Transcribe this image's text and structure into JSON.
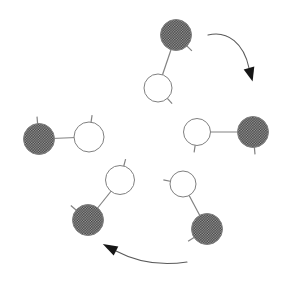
{
  "canvas": {
    "width": 295,
    "height": 284,
    "background": "#ffffff"
  },
  "colors": {
    "atom_outline": "#808080",
    "bond": "#828282",
    "open_atom_fill": "#ffffff",
    "shaded_atom_base": "#a2a2a2",
    "shaded_atom_dot": "#3a3a3a",
    "arrow_stroke": "#5a5a5a",
    "arrowhead_fill": "#161616"
  },
  "tick_len": 7,
  "molecules": [
    {
      "name": "top",
      "shaded": {
        "cx": 176,
        "cy": 35,
        "r": 15.5,
        "tick_angle": 45
      },
      "open": {
        "cx": 158,
        "cy": 88,
        "r": 14,
        "tick_angle": 48
      }
    },
    {
      "name": "right",
      "open": {
        "cx": 197,
        "cy": 132,
        "r": 13.5,
        "tick_angle": 98
      },
      "shaded": {
        "cx": 253,
        "cy": 132,
        "r": 15.5,
        "tick_angle": 85
      }
    },
    {
      "name": "left",
      "shaded": {
        "cx": 39,
        "cy": 139,
        "r": 15.5,
        "tick_angle": -95
      },
      "open": {
        "cx": 89,
        "cy": 137,
        "r": 15,
        "tick_angle": -82
      }
    },
    {
      "name": "bottom-left",
      "open": {
        "cx": 120,
        "cy": 180,
        "r": 14.5,
        "tick_angle": -75
      },
      "shaded": {
        "cx": 88,
        "cy": 220,
        "r": 15.5,
        "tick_angle": -140
      }
    },
    {
      "name": "bottom-right",
      "open": {
        "cx": 183,
        "cy": 184,
        "r": 13,
        "tick_angle": -168
      },
      "shaded": {
        "cx": 207,
        "cy": 229,
        "r": 15.5,
        "tick_angle": 147
      }
    }
  ],
  "arrows": [
    {
      "name": "rotation-arrow-top-right",
      "path": "M 208 35 C 228 30 244 44 249 68",
      "head": [
        [
          252.6,
          81.5
        ],
        [
          243.7,
          69.4
        ],
        [
          254.3,
          66.6
        ]
      ]
    },
    {
      "name": "rotation-arrow-bottom",
      "path": "M 187 262 Q 148 268 116 251",
      "head": [
        [
          102.8,
          244.0
        ],
        [
          118.3,
          246.6
        ],
        [
          113.7,
          255.4
        ]
      ]
    }
  ]
}
